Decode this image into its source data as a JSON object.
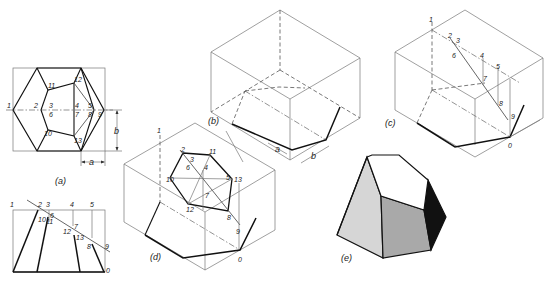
{
  "figure": {
    "views": {
      "a": {
        "caption": "(a)",
        "points": [
          "1",
          "2",
          "3",
          "4",
          "5",
          "6",
          "7",
          "8",
          "9",
          "10",
          "11",
          "12",
          "13"
        ],
        "dimensions": {
          "a": "a",
          "b": "b"
        }
      },
      "a_side": {
        "points": [
          "1",
          "2",
          "3",
          "4",
          "5",
          "6",
          "7",
          "8",
          "9",
          "10",
          "11",
          "12",
          "13",
          "0"
        ]
      },
      "b": {
        "caption": "(b)",
        "dimensions": {
          "a": "a",
          "b": "b"
        }
      },
      "c": {
        "caption": "(c)",
        "points": [
          "1",
          "2",
          "3",
          "4",
          "5",
          "6",
          "7",
          "8",
          "9",
          "0"
        ]
      },
      "d": {
        "caption": "(d)",
        "points": [
          "1",
          "2",
          "3",
          "4",
          "5",
          "6",
          "7",
          "8",
          "9",
          "10",
          "11",
          "12",
          "13",
          "0"
        ]
      },
      "e": {
        "caption": "(e)",
        "colors": {
          "light": "#d6d6d6",
          "mid": "#a9a9a9",
          "dark": "#111111",
          "top": "#ffffff"
        }
      }
    }
  }
}
